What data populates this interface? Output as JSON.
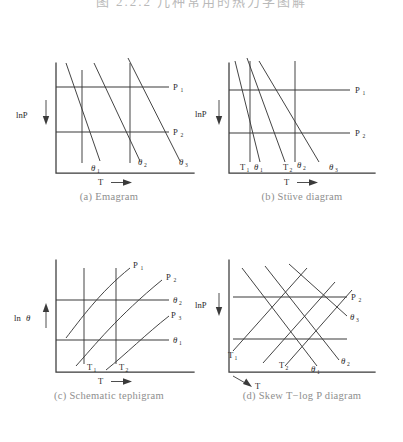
{
  "header": {
    "clipped_text": "图 2.2.2  几种常用的热力学图解"
  },
  "figure": {
    "background_color": "#ffffff",
    "line_color": "#3a3a3a",
    "caption_color": "#8e8e8e"
  },
  "panels": [
    {
      "id": "panel-a",
      "caption": "(a) Emagram",
      "y_axis_label": "lnP",
      "y_axis_direction": "down",
      "x_axis_label": "T",
      "x_axis_direction": "right",
      "isobars": [
        {
          "label": "P",
          "subscript": "1"
        },
        {
          "label": "P",
          "subscript": "2"
        }
      ],
      "adiabats": [
        {
          "label": "θ",
          "subscript": "1"
        },
        {
          "label": "θ",
          "subscript": "2"
        },
        {
          "label": "θ",
          "subscript": "3"
        }
      ],
      "isotherms_style": "vertical straight lines",
      "adiabats_style": "slanted straight lines sloping down-right"
    },
    {
      "id": "panel-b",
      "caption": "(b) Stüve diagram",
      "y_axis_label": "lnP",
      "y_axis_direction": "down",
      "x_axis_label": "T",
      "x_axis_direction": "right",
      "isobars": [
        {
          "label": "P",
          "subscript": "1"
        },
        {
          "label": "P",
          "subscript": "2"
        }
      ],
      "isotherms": [
        {
          "label": "T",
          "subscript": "1"
        },
        {
          "label": "T",
          "subscript": "2"
        }
      ],
      "adiabats": [
        {
          "label": "θ",
          "subscript": "1"
        },
        {
          "label": "θ",
          "subscript": "2"
        },
        {
          "label": "θ",
          "subscript": "3"
        }
      ],
      "isotherms_style": "vertical straight lines",
      "adiabats_style": "steep straight lines converging toward upper left"
    },
    {
      "id": "panel-c",
      "caption": "(c) Schematic tephigram",
      "y_axis_label": "lnθ",
      "y_axis_direction": "up",
      "x_axis_label": "T",
      "x_axis_direction": "right",
      "isobars": [
        {
          "label": "P",
          "subscript": "1"
        },
        {
          "label": "P",
          "subscript": "2"
        },
        {
          "label": "P",
          "subscript": "3"
        }
      ],
      "isotherms": [
        {
          "label": "T",
          "subscript": "1"
        },
        {
          "label": "T",
          "subscript": "2"
        }
      ],
      "adiabats": [
        {
          "label": "θ",
          "subscript": "1"
        },
        {
          "label": "θ",
          "subscript": "2"
        }
      ],
      "isobars_style": "curved lines rising to the right",
      "adiabats_style": "horizontal straight lines"
    },
    {
      "id": "panel-d",
      "caption": "(d) Skew T−log P diagram",
      "y_axis_label": "lnP",
      "y_axis_direction": "down",
      "x_axis_label": "T",
      "x_axis_direction": "down-right (skewed)",
      "isobars": [
        {
          "label": "P",
          "subscript": "2"
        }
      ],
      "isotherms": [
        {
          "label": "T",
          "subscript": "1"
        },
        {
          "label": "T",
          "subscript": "2"
        }
      ],
      "adiabats": [
        {
          "label": "θ",
          "subscript": "1"
        },
        {
          "label": "θ",
          "subscript": "2"
        },
        {
          "label": "θ",
          "subscript": "3"
        }
      ],
      "isotherms_style": "straight lines skewed up to the right",
      "adiabats_style": "straight lines sloping down to the right"
    }
  ]
}
